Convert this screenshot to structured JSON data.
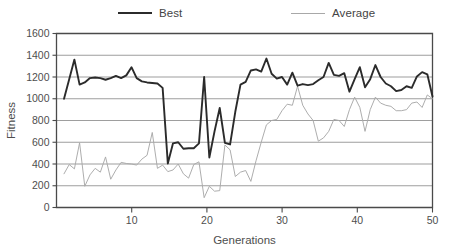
{
  "chart_data": {
    "type": "line",
    "title": "",
    "xlabel": "Generations",
    "ylabel": "Fitness",
    "xlim": [
      0,
      50
    ],
    "ylim": [
      0,
      1600
    ],
    "yticks": [
      0,
      200,
      400,
      600,
      800,
      1000,
      1200,
      1400,
      1600
    ],
    "xticks": [
      10,
      20,
      30,
      40,
      50
    ],
    "grid": true,
    "legend_position": "top",
    "x": [
      1,
      2,
      3,
      4,
      5,
      6,
      7,
      8,
      9,
      10,
      11,
      12,
      13,
      14,
      15,
      16,
      17,
      18,
      19,
      20,
      21,
      22,
      23,
      24,
      25,
      26,
      27,
      28,
      29,
      30,
      31,
      32,
      33,
      34,
      35,
      36,
      37,
      38,
      39,
      40,
      41,
      42,
      43,
      44,
      45,
      46,
      47,
      48,
      49,
      50
    ],
    "series": [
      {
        "name": "Best",
        "color": "#2b2b2b",
        "width": 1.9,
        "values": [
          1000,
          1180,
          1360,
          1130,
          1150,
          1190,
          1195,
          1190,
          1175,
          1190,
          1210,
          1190,
          1215,
          1290,
          1190,
          1160,
          1150,
          1145,
          1140,
          1100,
          405,
          590,
          600,
          540,
          545,
          545,
          590,
          1200,
          460,
          700,
          915,
          595,
          580,
          880,
          1130,
          1155,
          1260,
          1270,
          1250,
          1370,
          1230,
          1185,
          1200,
          1130,
          1240,
          1120,
          1135,
          1125,
          1135,
          1170
        ],
        "values_tail": [
          1200,
          1330,
          1220,
          1210,
          1235,
          1065,
          1180,
          1290,
          1105,
          1180,
          1310,
          1200,
          1140,
          1115,
          1070,
          1080,
          1115,
          1100,
          1205,
          1245,
          1225,
          1020
        ]
      },
      {
        "name": "Average",
        "color": "#a9a9a9",
        "width": 0.95,
        "values": [
          310,
          395,
          355,
          595,
          195,
          300,
          360,
          325,
          465,
          260,
          345,
          415,
          405,
          400,
          390,
          445,
          480,
          690,
          360,
          390,
          330,
          345,
          400,
          310,
          270,
          395,
          420,
          90,
          195,
          150,
          155,
          575,
          530,
          285,
          325,
          340,
          240,
          430,
          600,
          760,
          800,
          810,
          890,
          950,
          940,
          1115,
          940,
          860,
          800,
          610
        ],
        "values_tail": [
          640,
          700,
          810,
          800,
          745,
          900,
          1015,
          920,
          700,
          900,
          1015,
          960,
          940,
          930,
          890,
          890,
          900,
          960,
          970,
          920,
          1035,
          1000
        ]
      }
    ]
  },
  "legend": {
    "best_label": "Best",
    "average_label": "Average"
  },
  "axes": {
    "ylabel": "Fitness",
    "xlabel": "Generations",
    "ytick_labels": [
      "0",
      "200",
      "400",
      "600",
      "800",
      "1000",
      "1200",
      "1400",
      "1600"
    ],
    "xtick_labels": [
      "10",
      "20",
      "30",
      "40",
      "50"
    ]
  }
}
